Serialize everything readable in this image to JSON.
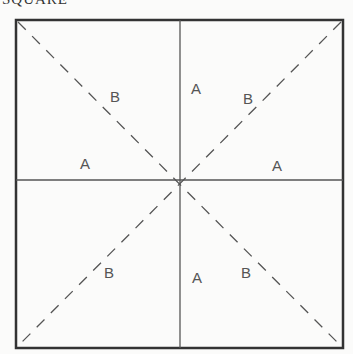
{
  "caption": "SQUARE",
  "colors": {
    "line": "#333333",
    "label": "#555555",
    "background": "#fbfbfa"
  },
  "labels": [
    {
      "text": "B",
      "x": 110,
      "y": 102
    },
    {
      "text": "A",
      "x": 196,
      "y": 94
    },
    {
      "text": "B",
      "x": 248,
      "y": 104
    },
    {
      "text": "A",
      "x": 86,
      "y": 169
    },
    {
      "text": "A",
      "x": 278,
      "y": 171
    },
    {
      "text": "B",
      "x": 110,
      "y": 278
    },
    {
      "text": "A",
      "x": 197,
      "y": 283
    },
    {
      "text": "B",
      "x": 247,
      "y": 278
    }
  ]
}
